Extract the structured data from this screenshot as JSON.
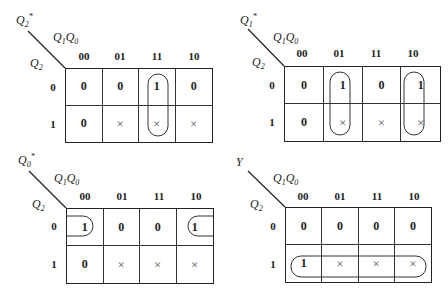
{
  "col_headers": [
    "00",
    "01",
    "11",
    "10"
  ],
  "row_headers": [
    "0",
    "1"
  ],
  "col_var_label": "Q1Q0",
  "row_var_label": "Q2",
  "maps": [
    {
      "output": "Q2*",
      "output_base": "Q",
      "output_sub": "2",
      "output_sup": "*",
      "cells": [
        [
          "0",
          "0",
          "1",
          "0"
        ],
        [
          "0",
          "×",
          "×",
          "×"
        ]
      ],
      "groups": [
        "column 11 (rows 0–1)"
      ]
    },
    {
      "output": "Q1*",
      "output_base": "Q",
      "output_sub": "1",
      "output_sup": "*",
      "cells": [
        [
          "0",
          "1",
          "0",
          "1"
        ],
        [
          "0",
          "×",
          "×",
          "×"
        ]
      ],
      "groups": [
        "column 01 (rows 0–1)",
        "column 10 (rows 0–1)"
      ]
    },
    {
      "output": "Q0*",
      "output_base": "Q",
      "output_sub": "0",
      "output_sup": "*",
      "cells": [
        [
          "1",
          "0",
          "0",
          "1"
        ],
        [
          "0",
          "×",
          "×",
          "×"
        ]
      ],
      "groups": [
        "row 0 wrap-around columns 00 and 10"
      ]
    },
    {
      "output": "Y",
      "output_base": "Y",
      "output_sub": "",
      "output_sup": "",
      "cells": [
        [
          "0",
          "0",
          "0",
          "0"
        ],
        [
          "1",
          "×",
          "×",
          "×"
        ]
      ],
      "groups": [
        "row 1 (all columns)"
      ]
    }
  ],
  "labels": {
    "q": "Q",
    "sub1": "1",
    "sub0": "0",
    "sub2": "2"
  }
}
